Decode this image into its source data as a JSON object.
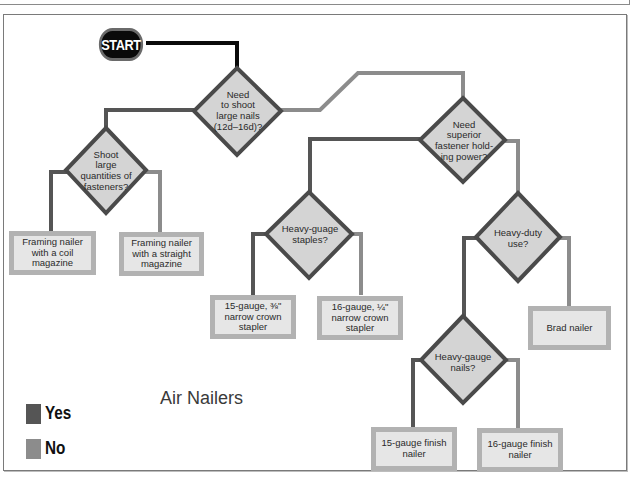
{
  "diagram": {
    "title": "Air Nailers",
    "start_label": "START",
    "colors": {
      "yes": "#555555",
      "no": "#8c8c8c",
      "start_line": "#0a0a0a",
      "diamond_fill": "#d4d4d4",
      "diamond_border": "#4a4a4a",
      "box_border": "#b2b2b2",
      "box_fill": "#e6e6e6"
    },
    "legend": [
      {
        "label": "Yes",
        "color": "#555555"
      },
      {
        "label": "No",
        "color": "#8c8c8c"
      }
    ],
    "decisions": [
      {
        "id": "d1",
        "text": "Need to shoot large nails (12d–16d)?",
        "lines": [
          "Need",
          "to shoot",
          "large nails",
          "(12d–16d)?"
        ]
      },
      {
        "id": "d2",
        "text": "Shoot large quantities of fasteners?",
        "lines": [
          "Shoot",
          "large",
          "quantities of",
          "fasteners?"
        ]
      },
      {
        "id": "d3",
        "text": "Need superior fastener holding power?",
        "lines": [
          "Need",
          "superior",
          "fastener hold-",
          "ing power?"
        ]
      },
      {
        "id": "d4",
        "text": "Heavy-guage staples?",
        "lines": [
          "Heavy-guage",
          "staples?"
        ]
      },
      {
        "id": "d5",
        "text": "Heavy-duty use?",
        "lines": [
          "Heavy-duty",
          "use?"
        ]
      },
      {
        "id": "d6",
        "text": "Heavy-gauge nails?",
        "lines": [
          "Heavy-gauge",
          "nails?"
        ]
      }
    ],
    "results": [
      {
        "id": "r1",
        "lines": [
          "Framing nailer",
          "with a coil",
          "magazine"
        ]
      },
      {
        "id": "r2",
        "lines": [
          "Framing nailer",
          "with a straight",
          "magazine"
        ]
      },
      {
        "id": "r3",
        "lines": [
          "15-gauge, ⅜\"",
          "narrow crown",
          "stapler"
        ]
      },
      {
        "id": "r4",
        "lines": [
          "16-gauge, ¼\"",
          "narrow crown",
          "stapler"
        ]
      },
      {
        "id": "r5",
        "lines": [
          "Brad nailer"
        ]
      },
      {
        "id": "r6",
        "lines": [
          "15-gauge finish",
          "nailer"
        ]
      },
      {
        "id": "r7",
        "lines": [
          "16-gauge finish",
          "nailer"
        ]
      }
    ]
  }
}
